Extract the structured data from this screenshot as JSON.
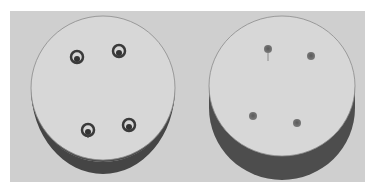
{
  "figure": {
    "background_color": "#cfcfcf",
    "top_face_color": "#d6d6d6",
    "side_band_color": "#4a4a4a",
    "panels": [
      {
        "name": "left-disc",
        "view": "slightly tilted",
        "holes": [
          {
            "cx": 76,
            "cy": 58,
            "style": "ringed"
          },
          {
            "cx": 119,
            "cy": 52,
            "style": "ringed"
          },
          {
            "cx": 88,
            "cy": 131,
            "style": "ringed"
          },
          {
            "cx": 129,
            "cy": 126,
            "style": "ringed"
          }
        ]
      },
      {
        "name": "right-disc",
        "view": "more tilted",
        "holes": [
          {
            "cx": 268,
            "cy": 49,
            "style": "plain"
          },
          {
            "cx": 311,
            "cy": 56,
            "style": "plain"
          },
          {
            "cx": 253,
            "cy": 116,
            "style": "plain"
          },
          {
            "cx": 297,
            "cy": 123,
            "style": "plain"
          }
        ]
      }
    ]
  }
}
